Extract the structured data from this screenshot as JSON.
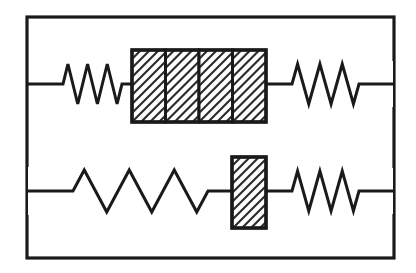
{
  "figure": {
    "title": "Mechanical network schematic: two parallel branches of springs and hatched blocks",
    "type": "mechanical-model-diagram",
    "background_color": "#ffffff",
    "ink_color": "#1a1a1a",
    "hatch_color": "#2b2b2b",
    "canvas": {
      "width": 416,
      "height": 273
    }
  },
  "border": {
    "label": "outer frame",
    "x": 27,
    "y": 17,
    "width": 367,
    "height": 241,
    "stroke_width": 3.2
  },
  "branches": [
    {
      "id": "top-branch",
      "label": "Upper branch",
      "wire_y": 84,
      "wire_start_x": 28,
      "wire_end_x": 393,
      "elements": [
        {
          "id": "top-left-spring",
          "type": "spring",
          "label": "Upper left spring",
          "x_start": 49,
          "x_end": 132,
          "peaks": 3,
          "amplitude": 20,
          "lead_in": 14,
          "lead_out": 10,
          "stroke_width": 3.0
        },
        {
          "id": "top-block",
          "type": "hatched-block",
          "label": "Upper four-cell hatched block",
          "x": 132,
          "y": 50,
          "width": 134,
          "height": 72,
          "cells": 4,
          "hatch_angle_deg": 45,
          "hatch_spacing": 9,
          "stroke_width": 3.0
        },
        {
          "id": "top-right-spring",
          "type": "spring",
          "label": "Upper right spring",
          "x_start": 266,
          "x_end": 393,
          "peaks": 3,
          "amplitude": 20,
          "lead_in": 26,
          "lead_out": 34,
          "stroke_width": 3.0
        }
      ]
    },
    {
      "id": "bottom-branch",
      "label": "Lower branch",
      "wire_y": 191,
      "wire_start_x": 28,
      "wire_end_x": 393,
      "elements": [
        {
          "id": "bottom-left-spring",
          "type": "spring",
          "label": "Lower left spring",
          "x_start": 28,
          "x_end": 232,
          "peaks": 3,
          "amplitude": 21,
          "lead_in": 45,
          "lead_out": 24,
          "stroke_width": 3.0
        },
        {
          "id": "bottom-block",
          "type": "hatched-block",
          "label": "Lower single hatched block",
          "x": 232,
          "y": 157,
          "width": 34,
          "height": 71,
          "cells": 1,
          "hatch_angle_deg": 45,
          "hatch_spacing": 9,
          "stroke_width": 3.0
        },
        {
          "id": "bottom-right-spring",
          "type": "spring",
          "label": "Lower right spring",
          "x_start": 266,
          "x_end": 393,
          "peaks": 3,
          "amplitude": 20,
          "lead_in": 26,
          "lead_out": 34,
          "stroke_width": 3.0
        }
      ]
    }
  ]
}
